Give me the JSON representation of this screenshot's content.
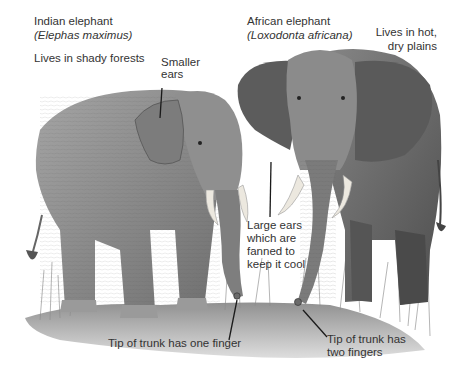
{
  "labels": {
    "indian": {
      "name": "Indian elephant",
      "latin": "(Elephas maximus)",
      "habitat": "Lives in shady forests",
      "ears_line1": "Smaller",
      "ears_line2": "ears",
      "trunk": "Tip of trunk has one finger"
    },
    "african": {
      "name": "African elephant",
      "latin": "(Loxodonta africana)",
      "habitat_line1": "Lives in hot,",
      "habitat_line2": "dry plains",
      "ears_line1": "Large ears",
      "ears_line2": "which are",
      "ears_line3": "fanned to",
      "ears_line4": "keep it cool",
      "trunk_line1": "Tip of trunk has",
      "trunk_line2": "two fingers"
    }
  },
  "colors": {
    "background": "#ffffff",
    "text": "#333333",
    "ground": "#9a9a9a",
    "indian_body": "#8c8c8c",
    "african_body": "#6e6e6e",
    "tusk": "#ece8df",
    "pointer": "#1a1a1a"
  }
}
